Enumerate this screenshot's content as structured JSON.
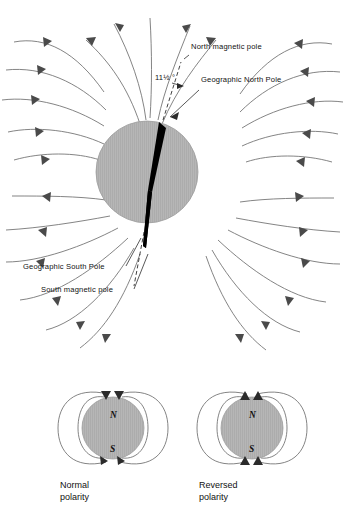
{
  "figure": {
    "type": "diagram"
  },
  "main_diagram": {
    "name": "earth-magnetic-field",
    "earth": {
      "fill_color": "#b3b3b3",
      "outline_color": "#9a9a9a",
      "center_x": 147,
      "center_y": 172,
      "radius": 51
    },
    "dipole_bar_color": "#000000",
    "labels": [
      {
        "id": "north-magnetic-pole",
        "text": "North magnetic pole",
        "x": 191,
        "y": 49
      },
      {
        "id": "geographic-north-pole",
        "text": "Geographic North Pole",
        "x": 201,
        "y": 82
      },
      {
        "id": "tilt-angle",
        "text": "11½ °",
        "x": 155,
        "y": 80
      },
      {
        "id": "geographic-south-pole",
        "text": "Geographic South Pole",
        "x": 23,
        "y": 269
      },
      {
        "id": "south-magnetic-pole",
        "text": "South magnetic pole",
        "x": 41,
        "y": 292
      }
    ],
    "field_line_color": "#6e6e6e",
    "arrow_color": "#4a4a4a"
  },
  "polarity_panels": [
    {
      "id": "normal-polarity",
      "caption_line1": "Normal",
      "caption_line2": "polarity",
      "north_label": "N",
      "south_label": "S",
      "north_label_position": "top",
      "south_label_position": "bottom",
      "top_arrow_direction": "inward-down",
      "bottom_arrow_direction": "outward-up",
      "center_x": 113,
      "center_y": 428,
      "radius": 31
    },
    {
      "id": "reversed-polarity",
      "caption_line1": "Reversed",
      "caption_line2": "polarity",
      "north_label": "N",
      "south_label": "S",
      "north_label_position": "top",
      "south_label_position": "bottom",
      "top_arrow_direction": "outward-up",
      "bottom_arrow_direction": "inward-up",
      "center_x": 252,
      "center_y": 428,
      "radius": 31
    }
  ]
}
